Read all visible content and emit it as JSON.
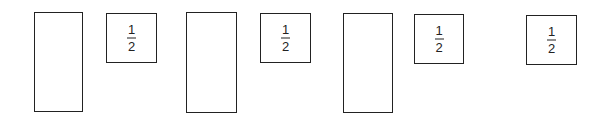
{
  "diagram": {
    "tall_boxes": [
      {
        "label": "",
        "x": 34,
        "y": 12,
        "w": 49,
        "h": 100
      },
      {
        "label": "",
        "x": 186,
        "y": 12,
        "w": 51,
        "h": 101
      },
      {
        "label": "",
        "x": 343,
        "y": 13,
        "w": 50,
        "h": 100
      }
    ],
    "fraction_boxes": [
      {
        "numerator": "1",
        "denominator": "2",
        "x": 106,
        "y": 13,
        "w": 51,
        "h": 50
      },
      {
        "numerator": "1",
        "denominator": "2",
        "x": 260,
        "y": 13,
        "w": 51,
        "h": 50
      },
      {
        "numerator": "1",
        "denominator": "2",
        "x": 414,
        "y": 14,
        "w": 50,
        "h": 50
      },
      {
        "numerator": "1",
        "denominator": "2",
        "x": 526,
        "y": 15,
        "w": 51,
        "h": 50
      }
    ],
    "stroke_color": "#222222",
    "background": "#ffffff"
  }
}
